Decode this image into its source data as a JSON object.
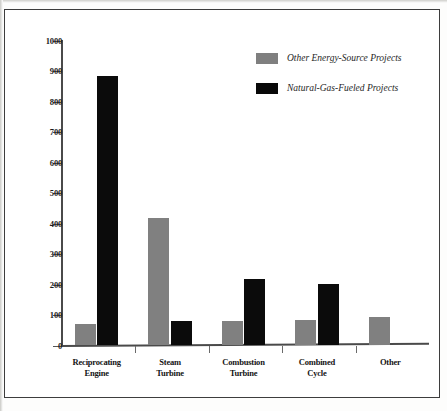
{
  "chart_data": {
    "type": "bar",
    "title": "",
    "subtitle": "",
    "xlabel": "",
    "ylabel": "",
    "ylim": [
      0,
      1000
    ],
    "ytick_step": 100,
    "yticks": [
      "1000",
      "900",
      "800",
      "700",
      "600",
      "500",
      "400",
      "300",
      "200",
      "100",
      "0"
    ],
    "grid": false,
    "legend_position": "top-right",
    "categories": [
      "Reciprocating\nEngine",
      "Steam\nTurbine",
      "Combustion\nTurbine",
      "Combined\nCycle",
      "Other"
    ],
    "category_labels": [
      {
        "line1": "Reciprocating",
        "line2": "Engine"
      },
      {
        "line1": "Steam",
        "line2": "Turbine"
      },
      {
        "line1": "Combustion",
        "line2": "Turbine"
      },
      {
        "line1": "Combined",
        "line2": "Cycle"
      },
      {
        "line1": "Other",
        "line2": ""
      }
    ],
    "series": [
      {
        "name": "Other Energy-Source Projects",
        "color": "#808080",
        "values": [
          70,
          420,
          82,
          85,
          92
        ]
      },
      {
        "name": "Natural-Gas-Fueled Projects",
        "color": "#0b0b0b",
        "values": [
          885,
          80,
          220,
          203,
          0
        ]
      }
    ]
  },
  "legend": {
    "items": [
      {
        "label": "Other Energy-Source Projects",
        "color": "#7f7f7f"
      },
      {
        "label": "Natural-Gas-Fueled Projects",
        "color": "#080808"
      }
    ]
  },
  "axis": {
    "y_ticks": [
      "1000",
      "900",
      "800",
      "700",
      "600",
      "500",
      "400",
      "300",
      "200",
      "100",
      "0"
    ]
  }
}
